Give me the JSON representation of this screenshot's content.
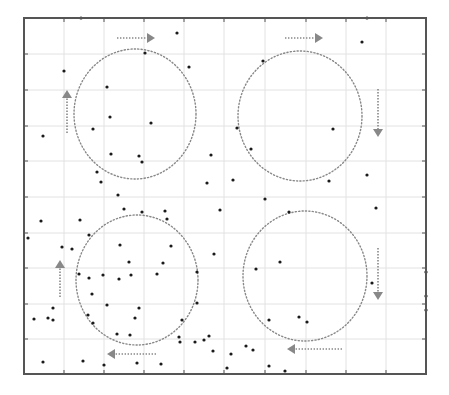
{
  "figure": {
    "width": 449,
    "height": 395,
    "background": "#ffffff",
    "frame": {
      "x0": 24,
      "y0": 18,
      "x1": 426,
      "y1": 374,
      "color": "#555555",
      "stroke_width": 2
    },
    "grid": {
      "color": "#e2e2e2",
      "x": [
        64,
        104,
        144,
        184,
        224,
        265,
        306,
        346,
        386
      ],
      "y": [
        54,
        90,
        126,
        161,
        197,
        233,
        268,
        304,
        339
      ],
      "tick_length": 4,
      "tick_color": "#555555"
    },
    "point_color": "#1a1a1a",
    "point_radius": 1.6,
    "dotted_color": "#888888"
  },
  "chart_data": {
    "type": "scatter",
    "title": "",
    "xlabel": "",
    "ylabel": "",
    "grid": true,
    "legend": null,
    "circles": [
      {
        "name": "top-left",
        "cx": 135,
        "cy": 114,
        "rx": 61,
        "ry": 65
      },
      {
        "name": "top-right",
        "cx": 300,
        "cy": 116,
        "rx": 62,
        "ry": 65
      },
      {
        "name": "bottom-left",
        "cx": 137,
        "cy": 280,
        "rx": 61,
        "ry": 65
      },
      {
        "name": "bottom-right",
        "cx": 305,
        "cy": 276,
        "rx": 62,
        "ry": 65
      }
    ],
    "arrows": [
      {
        "name": "top-left-right-arrow",
        "direction": "right",
        "x1": 117,
        "y1": 38,
        "x2": 155,
        "y2": 38
      },
      {
        "name": "top-right-right-arrow",
        "direction": "right",
        "x1": 285,
        "y1": 38,
        "x2": 323,
        "y2": 38
      },
      {
        "name": "top-right-down-arrow",
        "direction": "down",
        "x1": 378,
        "y1": 89,
        "x2": 378,
        "y2": 137
      },
      {
        "name": "bottom-right-down-arrow",
        "direction": "down",
        "x1": 378,
        "y1": 248,
        "x2": 378,
        "y2": 300
      },
      {
        "name": "bottom-right-left-arrow",
        "direction": "left",
        "x1": 342,
        "y1": 349,
        "x2": 287,
        "y2": 349
      },
      {
        "name": "bottom-left-left-arrow",
        "direction": "left",
        "x1": 156,
        "y1": 354,
        "x2": 107,
        "y2": 354
      },
      {
        "name": "bottom-left-up-arrow",
        "direction": "up",
        "x1": 60,
        "y1": 297,
        "x2": 60,
        "y2": 260
      },
      {
        "name": "top-left-up-arrow",
        "direction": "up",
        "x1": 67,
        "y1": 133,
        "x2": 67,
        "y2": 90
      }
    ],
    "points": [
      [
        81,
        18
      ],
      [
        367,
        18
      ],
      [
        177,
        33
      ],
      [
        362,
        42
      ],
      [
        145,
        53
      ],
      [
        263,
        61
      ],
      [
        189,
        67
      ],
      [
        64,
        71
      ],
      [
        107,
        87
      ],
      [
        110,
        117
      ],
      [
        151,
        123
      ],
      [
        93,
        129
      ],
      [
        237,
        128
      ],
      [
        333,
        129
      ],
      [
        43,
        136
      ],
      [
        251,
        149
      ],
      [
        111,
        154
      ],
      [
        139,
        156
      ],
      [
        211,
        155
      ],
      [
        142,
        162
      ],
      [
        97,
        172
      ],
      [
        367,
        175
      ],
      [
        233,
        180
      ],
      [
        329,
        181
      ],
      [
        101,
        182
      ],
      [
        207,
        183
      ],
      [
        118,
        195
      ],
      [
        265,
        199
      ],
      [
        124,
        209
      ],
      [
        165,
        211
      ],
      [
        142,
        212
      ],
      [
        220,
        210
      ],
      [
        289,
        212
      ],
      [
        376,
        208
      ],
      [
        80,
        220
      ],
      [
        41,
        221
      ],
      [
        167,
        219
      ],
      [
        89,
        235
      ],
      [
        28,
        238
      ],
      [
        120,
        245
      ],
      [
        171,
        246
      ],
      [
        62,
        247
      ],
      [
        72,
        249
      ],
      [
        214,
        254
      ],
      [
        280,
        262
      ],
      [
        129,
        262
      ],
      [
        163,
        263
      ],
      [
        256,
        269
      ],
      [
        197,
        272
      ],
      [
        79,
        274
      ],
      [
        157,
        274
      ],
      [
        103,
        275
      ],
      [
        131,
        275
      ],
      [
        89,
        278
      ],
      [
        119,
        279
      ],
      [
        372,
        283
      ],
      [
        426,
        272
      ],
      [
        92,
        294
      ],
      [
        426,
        296
      ],
      [
        197,
        303
      ],
      [
        107,
        305
      ],
      [
        53,
        308
      ],
      [
        139,
        308
      ],
      [
        426,
        310
      ],
      [
        88,
        315
      ],
      [
        299,
        317
      ],
      [
        48,
        318
      ],
      [
        135,
        318
      ],
      [
        34,
        319
      ],
      [
        53,
        320
      ],
      [
        182,
        320
      ],
      [
        269,
        320
      ],
      [
        307,
        322
      ],
      [
        93,
        323
      ],
      [
        117,
        334
      ],
      [
        130,
        335
      ],
      [
        209,
        336
      ],
      [
        179,
        337
      ],
      [
        204,
        340
      ],
      [
        180,
        342
      ],
      [
        195,
        342
      ],
      [
        246,
        346
      ],
      [
        253,
        350
      ],
      [
        213,
        351
      ],
      [
        231,
        354
      ],
      [
        83,
        361
      ],
      [
        43,
        362
      ],
      [
        137,
        363
      ],
      [
        161,
        364
      ],
      [
        104,
        365
      ],
      [
        269,
        366
      ],
      [
        227,
        368
      ],
      [
        285,
        371
      ]
    ]
  }
}
